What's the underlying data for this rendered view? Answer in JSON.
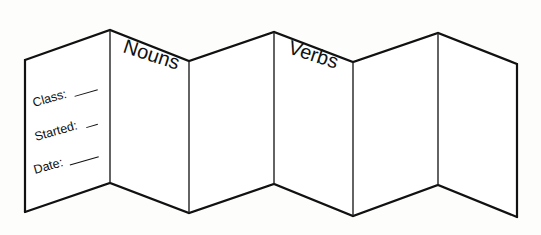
{
  "diagram": {
    "type": "accordion-fold-booklet",
    "panel_count": 6,
    "headings": {
      "panel_2": "Nouns",
      "panel_4": "Verbs"
    },
    "cover_fields": [
      {
        "label": "Class:"
      },
      {
        "label": "Started:"
      },
      {
        "label": "Date:"
      }
    ],
    "colors": {
      "line": "#111111",
      "paper": "#ffffff",
      "background": "#fdfdfb"
    }
  }
}
